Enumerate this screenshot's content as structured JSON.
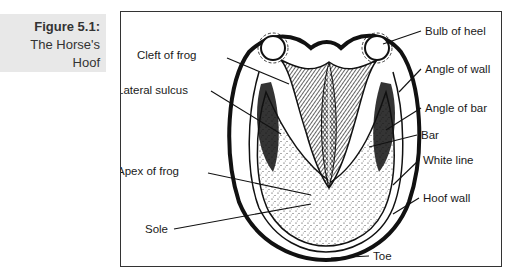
{
  "figure": {
    "number": "Figure 5.1:",
    "title_line1": "The Horse's",
    "title_line2": "Hoof"
  },
  "diagram": {
    "labels": {
      "cleft_of_frog": "Cleft of frog",
      "lateral_sulcus": "Lateral sulcus",
      "apex_of_frog": "Apex of frog",
      "sole": "Sole",
      "bulb_of_heel": "Bulb of heel",
      "angle_of_wall": "Angle of wall",
      "angle_of_bar": "Angle of bar",
      "bar": "Bar",
      "white_line": "White line",
      "hoof_wall": "Hoof wall",
      "toe": "Toe"
    }
  },
  "colors": {
    "caption_bg": "#e8e8e8",
    "ink": "#1a1a1a",
    "frame": "#333333"
  }
}
